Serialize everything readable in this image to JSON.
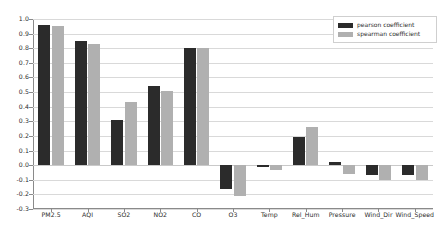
{
  "chart_data": {
    "type": "bar",
    "title": "",
    "subtitle": "",
    "xlabel": "",
    "ylabel": "",
    "grid": true,
    "legend_position": "top-right",
    "ylim": [
      -0.3,
      1.0
    ],
    "ytick_step": 0.1,
    "categories": [
      "PM2.5",
      "AQI",
      "SO2",
      "NO2",
      "CO",
      "O3",
      "Temp",
      "Rel_Hum",
      "Pressure",
      "Wind_Dir",
      "Wind_Speed"
    ],
    "ytick_labels": [
      "1.0",
      "0.9",
      "0.8",
      "0.7",
      "0.6",
      "0.5",
      "0.4",
      "0.3",
      "0.2",
      "0.1",
      "0.0",
      "-0.1",
      "-0.2",
      "-0.3"
    ],
    "ytick_values": [
      1.0,
      0.9,
      0.8,
      0.7,
      0.6,
      0.5,
      0.4,
      0.3,
      0.2,
      0.1,
      0.0,
      -0.1,
      -0.2,
      -0.3
    ],
    "series": [
      {
        "name": "pearson coefficient",
        "color": "#2b2b2b",
        "values": [
          0.96,
          0.85,
          0.31,
          0.545,
          0.805,
          -0.16,
          -0.01,
          0.19,
          0.02,
          -0.07,
          -0.07
        ]
      },
      {
        "name": "spearman coefficient",
        "color": "#b0b0b0",
        "values": [
          0.95,
          0.83,
          0.43,
          0.51,
          0.805,
          -0.21,
          -0.03,
          0.26,
          -0.06,
          -0.1,
          -0.1
        ]
      }
    ]
  },
  "legend": {
    "entries": [
      {
        "label": "pearson coefficient",
        "color": "#2b2b2b"
      },
      {
        "label": "spearman coefficient",
        "color": "#b0b0b0"
      }
    ]
  }
}
